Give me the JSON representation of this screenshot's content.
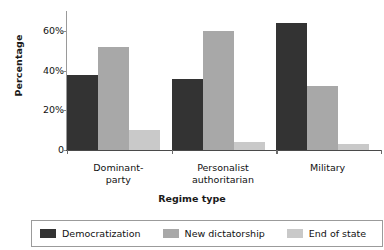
{
  "chart_data": {
    "type": "bar",
    "title": "",
    "xlabel": "Regime type",
    "ylabel": "Percentage",
    "categories": [
      "Dominant-party",
      "Personalist authoritarian",
      "Military"
    ],
    "category_lines": [
      [
        "Dominant-",
        "party"
      ],
      [
        "Personalist",
        "authoritarian"
      ],
      [
        "Military"
      ]
    ],
    "series": [
      {
        "name": "Democratization",
        "color": "#333333",
        "values": [
          38,
          36,
          64
        ]
      },
      {
        "name": "New dictatorship",
        "color": "#a8a8a8",
        "values": [
          52,
          60,
          32
        ]
      },
      {
        "name": "End of state",
        "color": "#c9c9c9",
        "values": [
          10,
          4,
          3
        ]
      }
    ],
    "ylim": [
      0,
      70
    ],
    "yticks": [
      0,
      20,
      40,
      60
    ],
    "ytick_labels": [
      "0",
      "20%",
      "40%",
      "60%"
    ],
    "grid": false,
    "legend_position": "bottom"
  },
  "legend": {
    "items": [
      {
        "label": "Democratization"
      },
      {
        "label": "New dictatorship"
      },
      {
        "label": "End of state"
      }
    ]
  }
}
